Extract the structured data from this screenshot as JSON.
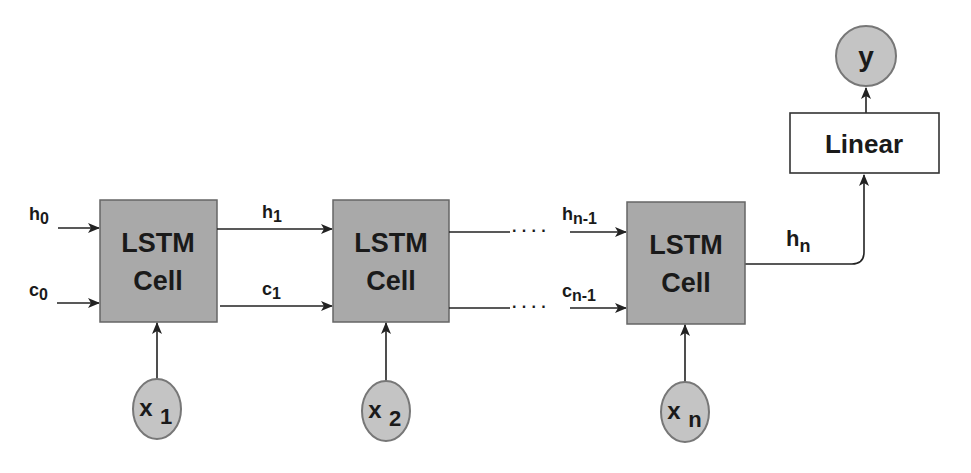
{
  "diagram": {
    "type": "lstm-unrolled",
    "colors": {
      "cell_fill": "#a9a9a9",
      "node_fill": "#c4c4c4",
      "stroke": "#333333",
      "linear_fill": "#ffffff"
    },
    "cells": [
      {
        "line1": "LSTM",
        "line2": "Cell"
      },
      {
        "line1": "LSTM",
        "line2": "Cell"
      },
      {
        "line1": "LSTM",
        "line2": "Cell"
      }
    ],
    "inputs": [
      {
        "base": "x",
        "sub": "1"
      },
      {
        "base": "x",
        "sub": "2"
      },
      {
        "base": "x",
        "sub": "n"
      }
    ],
    "states": {
      "h0": {
        "base": "h",
        "sub": "0"
      },
      "c0": {
        "base": "c",
        "sub": "0"
      },
      "h1": {
        "base": "h",
        "sub": "1"
      },
      "c1": {
        "base": "c",
        "sub": "1"
      },
      "hn1": {
        "base": "h",
        "sub": "n-1"
      },
      "cn1": {
        "base": "c",
        "sub": "n-1"
      },
      "hn": {
        "base": "h",
        "sub": "n"
      }
    },
    "ellipsis": "· · · ·",
    "linear": {
      "label": "Linear"
    },
    "output": {
      "label": "y"
    }
  }
}
